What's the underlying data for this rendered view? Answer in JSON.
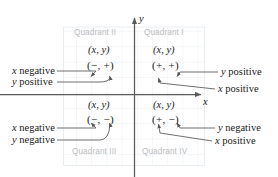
{
  "figure": {
    "type": "coordinate-plane-quadrant-diagram",
    "axes": {
      "x_label": "x",
      "y_label": "y",
      "x_axis_name": "x-axis",
      "y_axis_name": "y-axis"
    },
    "quadrants": [
      {
        "id": "quadrant-2",
        "name": "Quadrant II",
        "ordered_pair": "(x, y)",
        "signs": "(−, +)",
        "sign_x": "−",
        "sign_y": "+",
        "callouts": [
          "x negative",
          "y positive"
        ]
      },
      {
        "id": "quadrant-1",
        "name": "Quadrant I",
        "ordered_pair": "(x, y)",
        "signs": "(+, +)",
        "sign_x": "+",
        "sign_y": "+",
        "callouts": [
          "y positive",
          "x positive"
        ]
      },
      {
        "id": "quadrant-3",
        "name": "Quadrant III",
        "ordered_pair": "(x, y)",
        "signs": "(−, −)",
        "sign_x": "−",
        "sign_y": "−",
        "callouts": [
          "x negative",
          "y negative"
        ]
      },
      {
        "id": "quadrant-4",
        "name": "Quadrant IV",
        "ordered_pair": "(x, y)",
        "signs": "(+, −)",
        "sign_x": "+",
        "sign_y": "−",
        "callouts": [
          "y negative",
          "x positive"
        ]
      }
    ],
    "callouts": {
      "top_left_1": "x negative",
      "top_left_2": "y positive",
      "top_right_1": "y positive",
      "top_right_2": "x positive",
      "bottom_left_1": "x negative",
      "bottom_left_2": "y negative",
      "bottom_right_1": "y negative",
      "bottom_right_2": "x positive"
    },
    "colors": {
      "axis": "#5a5a5a",
      "grid": "#dfe6ec",
      "quadrant_label": "#b9bcc0",
      "text": "#1a1a1a",
      "leader": "#555555",
      "background": "#ffffff"
    }
  }
}
